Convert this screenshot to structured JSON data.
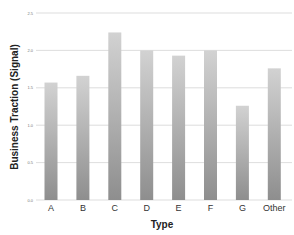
{
  "chart_data": {
    "type": "bar",
    "title": "",
    "xlabel": "Type",
    "ylabel": "Business Traction (Signal)",
    "categories": [
      "A",
      "B",
      "C",
      "D",
      "E",
      "F",
      "G",
      "Other"
    ],
    "values": [
      1.57,
      1.66,
      2.24,
      2.0,
      1.93,
      2.0,
      1.26,
      1.76
    ],
    "ylim": [
      0,
      2.5
    ],
    "yticks": [
      0.0,
      0.5,
      1.0,
      1.5,
      2.0,
      2.5
    ],
    "ytick_labels": [
      "0.0",
      "0.5",
      "1.0",
      "1.5",
      "2.0",
      "2.5"
    ],
    "grid": true,
    "legend": "none",
    "colors": {
      "bar_top": "#d2d2d2",
      "bar_bottom": "#8e8e8e",
      "grid": "#d4d4d4"
    }
  }
}
